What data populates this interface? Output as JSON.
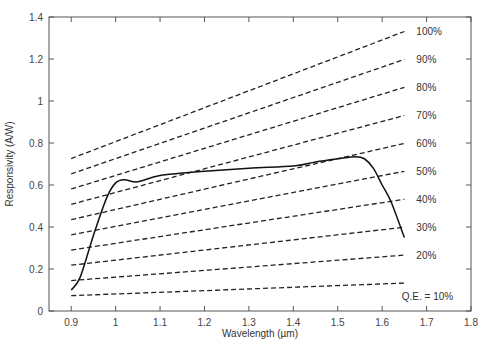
{
  "chart_data": {
    "type": "line",
    "title": "",
    "xlabel": "Wavelength (µm)",
    "ylabel": "Responsivity (A/W)",
    "xlim": [
      0.85,
      1.8
    ],
    "ylim": [
      0,
      1.4
    ],
    "xticks": [
      0.9,
      1,
      1.1,
      1.2,
      1.3,
      1.4,
      1.5,
      1.6,
      1.7,
      1.8
    ],
    "xtick_labels": [
      "0.9",
      "1",
      "1.1",
      "1.2",
      "1.3",
      "1.4",
      "1.5",
      "1.6",
      "1.7",
      "1.8"
    ],
    "yticks": [
      0,
      0.2,
      0.4,
      0.6,
      0.8,
      1,
      1.2,
      1.4
    ],
    "ytick_labels": [
      "0",
      "0.2",
      "0.4",
      "0.6",
      "0.8",
      "1",
      "1.2",
      "1.4"
    ],
    "grid": false,
    "legend": "inline labels at right end of dashed lines",
    "series": [
      {
        "name": "Measured responsivity",
        "style": "solid",
        "x": [
          0.9,
          0.92,
          0.95,
          0.98,
          1.0,
          1.02,
          1.05,
          1.1,
          1.2,
          1.3,
          1.4,
          1.45,
          1.5,
          1.54,
          1.56,
          1.58,
          1.6,
          1.62,
          1.65
        ],
        "y": [
          0.1,
          0.16,
          0.36,
          0.54,
          0.61,
          0.625,
          0.615,
          0.645,
          0.665,
          0.68,
          0.69,
          0.71,
          0.725,
          0.735,
          0.725,
          0.68,
          0.6,
          0.52,
          0.35
        ]
      }
    ],
    "qe_lines": {
      "style": "dashed",
      "x_range": [
        0.9,
        1.65
      ],
      "formula": "R = QE * wavelength / 1.24",
      "lines": [
        {
          "qe": 1.0,
          "label": "100%",
          "y_start": 0.726,
          "y_end": 1.331
        },
        {
          "qe": 0.9,
          "label": "90%",
          "y_start": 0.653,
          "y_end": 1.198
        },
        {
          "qe": 0.8,
          "label": "80%",
          "y_start": 0.581,
          "y_end": 1.065
        },
        {
          "qe": 0.7,
          "label": "70%",
          "y_start": 0.508,
          "y_end": 0.931
        },
        {
          "qe": 0.6,
          "label": "60%",
          "y_start": 0.435,
          "y_end": 0.798
        },
        {
          "qe": 0.5,
          "label": "50%",
          "y_start": 0.363,
          "y_end": 0.665
        },
        {
          "qe": 0.4,
          "label": "40%",
          "y_start": 0.29,
          "y_end": 0.532
        },
        {
          "qe": 0.3,
          "label": "30%",
          "y_start": 0.218,
          "y_end": 0.399
        },
        {
          "qe": 0.2,
          "label": "20%",
          "y_start": 0.145,
          "y_end": 0.266
        },
        {
          "qe": 0.1,
          "label": "Q.E. = 10%",
          "y_start": 0.073,
          "y_end": 0.133
        }
      ]
    }
  }
}
